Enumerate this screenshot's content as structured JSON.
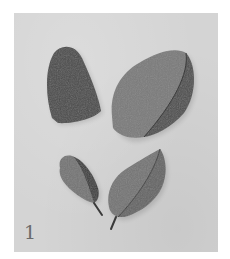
{
  "figure": {
    "number": "1",
    "background_color": "#d4d4d4",
    "leaves": [
      {
        "name": "leaf-top-left",
        "shape": "oblong, rounded tip",
        "tone": "#4e4e4e"
      },
      {
        "name": "leaf-top-right",
        "shape": "broad obovate, folded along midrib",
        "tone": "#6a6a6a"
      },
      {
        "name": "leaf-bottom-left",
        "shape": "small elliptic with petiole",
        "tone": "#5c5c5c"
      },
      {
        "name": "leaf-bottom-right",
        "shape": "elliptic with petiole, folded",
        "tone": "#6e6e6e"
      }
    ]
  }
}
